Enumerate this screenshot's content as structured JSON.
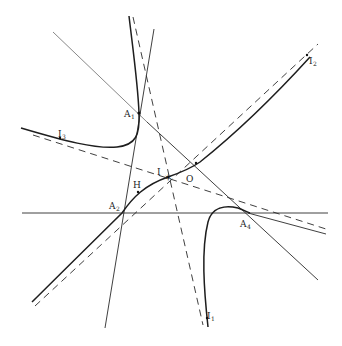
{
  "labels": {
    "A1": {
      "text": "A",
      "sub": "1"
    },
    "A2": {
      "text": "A",
      "sub": "2"
    },
    "A4": {
      "text": "A",
      "sub": "4"
    },
    "I": {
      "text": "I"
    },
    "O": {
      "text": "O"
    },
    "H": {
      "text": "H"
    },
    "I1": {
      "text": "I",
      "sub": "1"
    },
    "I2": {
      "text": "I",
      "sub": "2"
    },
    "I3": {
      "text": "I",
      "sub": "3"
    }
  }
}
